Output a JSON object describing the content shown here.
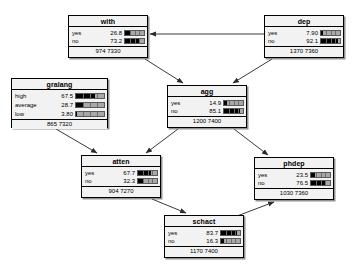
{
  "diagram": {
    "type": "bayesian-network",
    "title": "",
    "background": "#ffffff",
    "bar_color": "#000000",
    "track_color": "#a8a8a8",
    "node_fill": "#f2f2f2",
    "border_color": "#000000"
  },
  "nodes": [
    {
      "id": "with",
      "title": "with",
      "x": 68,
      "y": 15,
      "w": 80,
      "h": 43,
      "bar_ticks": 4,
      "states": [
        {
          "label": "yes",
          "value": "26.8",
          "pct": 26.8
        },
        {
          "label": "no",
          "value": "73.2",
          "pct": 73.2
        }
      ],
      "footer": "974 7330"
    },
    {
      "id": "dep",
      "title": "dep",
      "x": 264,
      "y": 15,
      "w": 80,
      "h": 43,
      "bar_ticks": 4,
      "states": [
        {
          "label": "yes",
          "value": "7.90",
          "pct": 7.9
        },
        {
          "label": "no",
          "value": "92.1",
          "pct": 92.1
        }
      ],
      "footer": "1370 7360"
    },
    {
      "id": "gralang",
      "title": "gralang",
      "x": 11,
      "y": 78,
      "w": 97,
      "h": 50,
      "bar_ticks": 4,
      "states": [
        {
          "label": "high",
          "value": "67.5",
          "pct": 67.5
        },
        {
          "label": "average",
          "value": "28.7",
          "pct": 28.7
        },
        {
          "label": "low",
          "value": "3.80",
          "pct": 3.8
        }
      ],
      "footer": "865 7320"
    },
    {
      "id": "agg",
      "title": "agg",
      "x": 167,
      "y": 85,
      "w": 80,
      "h": 43,
      "bar_ticks": 4,
      "states": [
        {
          "label": "yes",
          "value": "14.9",
          "pct": 14.9
        },
        {
          "label": "no",
          "value": "85.1",
          "pct": 85.1
        }
      ],
      "footer": "1200 7400"
    },
    {
      "id": "atten",
      "title": "atten",
      "x": 81,
      "y": 155,
      "w": 80,
      "h": 43,
      "bar_ticks": 4,
      "states": [
        {
          "label": "yes",
          "value": "67.7",
          "pct": 67.7
        },
        {
          "label": "no",
          "value": "32.3",
          "pct": 32.3
        }
      ],
      "footer": "904 7270"
    },
    {
      "id": "phdep",
      "title": "phdep",
      "x": 254,
      "y": 157,
      "w": 80,
      "h": 43,
      "bar_ticks": 4,
      "states": [
        {
          "label": "yes",
          "value": "23.5",
          "pct": 23.5
        },
        {
          "label": "no",
          "value": "76.5",
          "pct": 76.5
        }
      ],
      "footer": "1030 7360"
    },
    {
      "id": "schact",
      "title": "schact",
      "x": 164,
      "y": 215,
      "w": 80,
      "h": 43,
      "bar_ticks": 4,
      "states": [
        {
          "label": "yes",
          "value": "83.7",
          "pct": 83.7
        },
        {
          "label": "no",
          "value": "16.3",
          "pct": 16.3
        }
      ],
      "footer": "1170 7400"
    }
  ],
  "edges": [
    {
      "from": "dep",
      "to": "with",
      "x1": 264,
      "y1": 34,
      "x2": 150,
      "y2": 34
    },
    {
      "from": "with",
      "to": "agg",
      "x1": 145,
      "y1": 59,
      "x2": 183,
      "y2": 83
    },
    {
      "from": "dep",
      "to": "agg",
      "x1": 272,
      "y1": 59,
      "x2": 233,
      "y2": 83
    },
    {
      "from": "gralang",
      "to": "atten",
      "x1": 56,
      "y1": 129,
      "x2": 97,
      "y2": 153
    },
    {
      "from": "agg",
      "to": "atten",
      "x1": 178,
      "y1": 129,
      "x2": 146,
      "y2": 153
    },
    {
      "from": "agg",
      "to": "phdep",
      "x1": 234,
      "y1": 129,
      "x2": 268,
      "y2": 155
    },
    {
      "from": "atten",
      "to": "schact",
      "x1": 152,
      "y1": 199,
      "x2": 186,
      "y2": 213
    },
    {
      "from": "schact",
      "to": "phdep",
      "x1": 237,
      "y1": 216,
      "x2": 274,
      "y2": 202
    }
  ]
}
